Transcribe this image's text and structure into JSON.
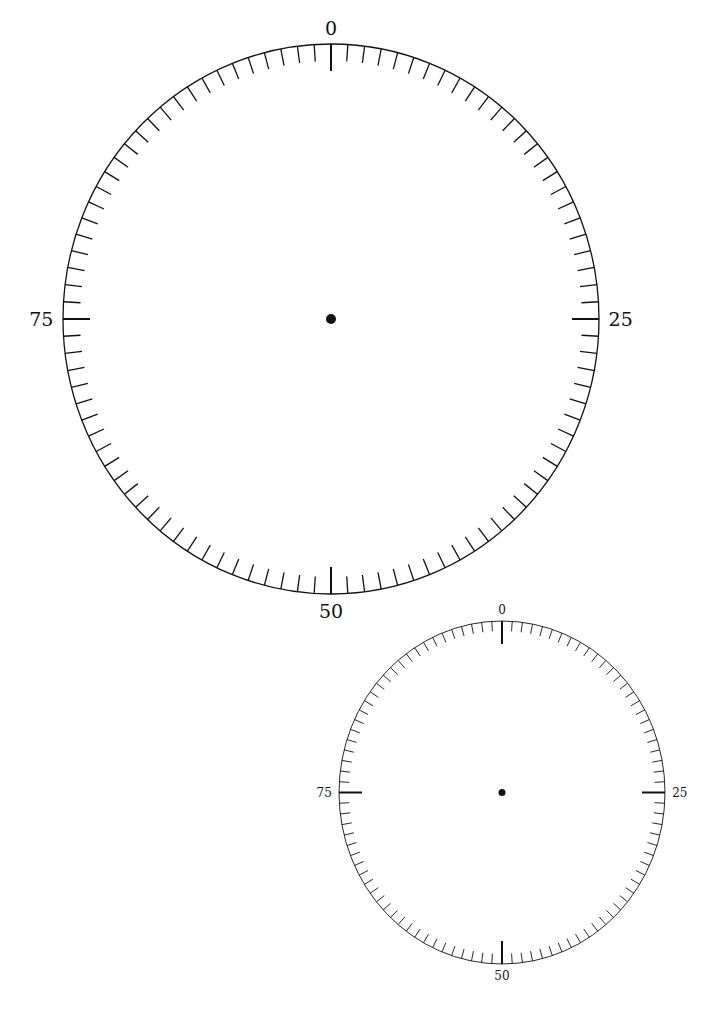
{
  "dials": [
    {
      "id": "large",
      "cx": 331,
      "cy": 319,
      "rx": 268,
      "ry": 275,
      "divisions": 100,
      "major_every": 25,
      "minor_len": 17,
      "major_len": 27,
      "stroke": 1.3,
      "major_stroke": 2,
      "dot_r": 5,
      "font_size": 19,
      "label_offset": 16,
      "labels": [
        "0",
        "25",
        "50",
        "75"
      ]
    },
    {
      "id": "small",
      "cx": 502,
      "cy": 792.5,
      "rx": 163,
      "ry": 171.5,
      "divisions": 100,
      "major_every": 25,
      "minor_len": 10,
      "major_len": 23,
      "stroke": 0.9,
      "major_stroke": 2,
      "dot_r": 3.5,
      "font_size": 12,
      "label_offset": 12,
      "labels": [
        "0",
        "25",
        "50",
        "75"
      ]
    }
  ],
  "colors": {
    "ink": "#111111",
    "background": "#ffffff"
  }
}
